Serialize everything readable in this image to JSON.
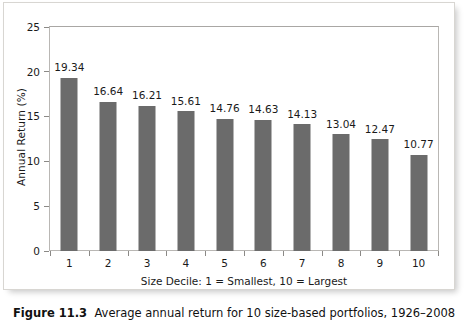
{
  "chart_data": {
    "type": "bar",
    "title": "",
    "xlabel": "Size Decile: 1 = Smallest, 10 = Largest",
    "ylabel": "Annual Return (%)",
    "categories": [
      "1",
      "2",
      "3",
      "4",
      "5",
      "6",
      "7",
      "8",
      "9",
      "10"
    ],
    "values": [
      19.34,
      16.64,
      16.21,
      15.61,
      14.76,
      14.63,
      14.13,
      13.04,
      12.47,
      10.77
    ],
    "value_labels": [
      "19.34",
      "16.64",
      "16.21",
      "15.61",
      "14.76",
      "14.63",
      "14.13",
      "13.04",
      "12.47",
      "10.77"
    ],
    "ylim": [
      0,
      25
    ],
    "yticks": [
      0,
      5,
      10,
      15,
      20,
      25
    ],
    "ytick_labels": [
      "0",
      "5",
      "10",
      "15",
      "20",
      "25"
    ],
    "grid": false,
    "legend": false,
    "bar_color": "#6b6b6b",
    "axis_color": "#8b8986",
    "frame_color": "#b9b7b4",
    "background": "#ffffff"
  },
  "caption": {
    "label": "Figure 11.3",
    "text": "Average annual return for 10 size-based portfolios, 1926–2008"
  }
}
